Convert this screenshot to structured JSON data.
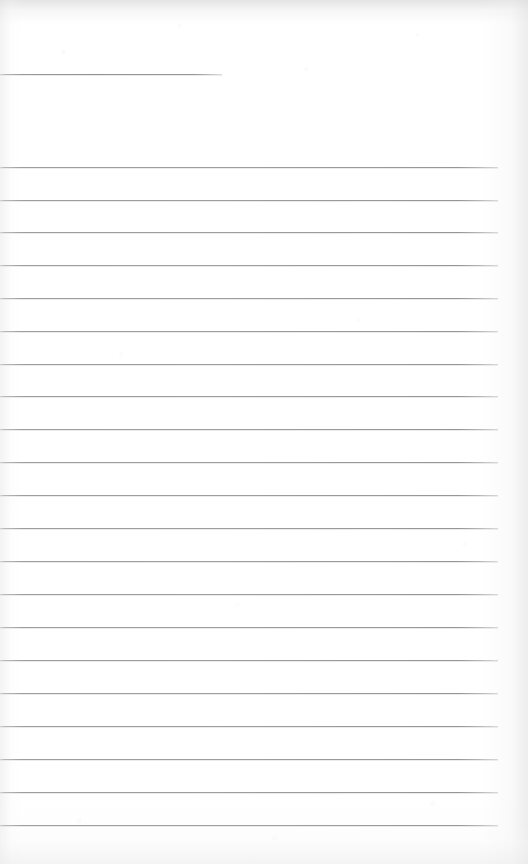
{
  "document": {
    "kind": "scanned-ruled-paper",
    "title": "",
    "page_width": 528,
    "page_height": 864,
    "paper_color": "#ffffff",
    "rule_color": "#9a9a9c",
    "text_content": "",
    "is_blank": true
  },
  "header_rule": {
    "name": "title-rule",
    "x_start": 0,
    "x_end": 222,
    "y": 74,
    "thickness": 1
  },
  "body_rules": {
    "count": 21,
    "x_start": 0,
    "x_end": 498,
    "first_y": 167,
    "spacing": 32.85,
    "thickness": 1,
    "y_positions": [
      167,
      200,
      232,
      265,
      298,
      331,
      364,
      396,
      429,
      462,
      495,
      528,
      561,
      594,
      627,
      660,
      693,
      726,
      759,
      792,
      825
    ]
  },
  "scan_artifacts": {
    "top_band_color": "#e2e2e4",
    "right_edge_color": "#dedee0",
    "left_edge_color": "#e4e4e6",
    "bottom_edge_color": "#ececee"
  }
}
